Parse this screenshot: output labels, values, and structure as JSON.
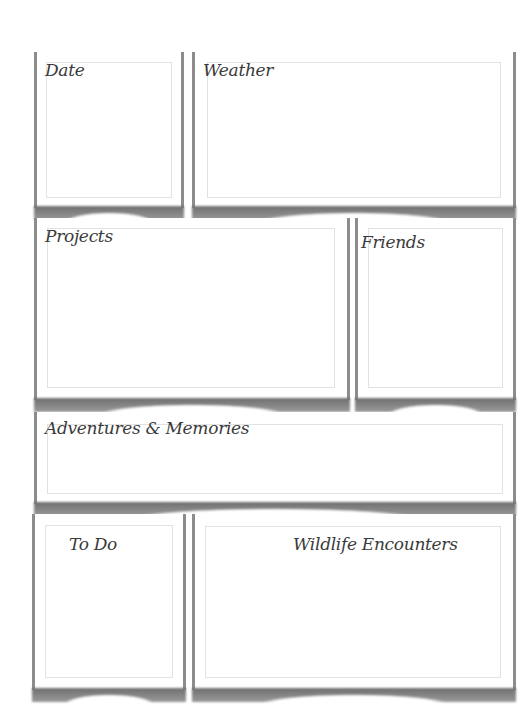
{
  "page": {
    "sections": [
      {
        "id": "date",
        "title": "Date"
      },
      {
        "id": "weather",
        "title": "Weather"
      },
      {
        "id": "projects",
        "title": "Projects"
      },
      {
        "id": "friends",
        "title": "Friends"
      },
      {
        "id": "adventures",
        "title": "Adventures & Memories"
      },
      {
        "id": "todo",
        "title": "To Do"
      },
      {
        "id": "wildlife",
        "title": "Wildlife Encounters"
      }
    ]
  },
  "colors": {
    "card_border": "#8c8c8c",
    "inner_border": "#e2e2e2",
    "title_text": "#3a3a3a",
    "background": "#ffffff"
  }
}
